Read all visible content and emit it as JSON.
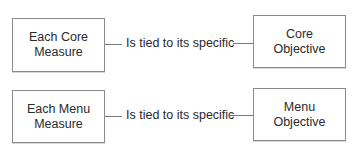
{
  "rows": [
    {
      "left_box": {
        "line1": "Each Core",
        "line2": "Measure"
      },
      "connector_label": "Is tied to its specific",
      "right_box": {
        "line1": "Core",
        "line2": "Objective"
      }
    },
    {
      "left_box": {
        "line1": "Each Menu",
        "line2": "Measure"
      },
      "connector_label": "Is tied to its specific",
      "right_box": {
        "line1": "Menu",
        "line2": "Objective"
      }
    }
  ]
}
